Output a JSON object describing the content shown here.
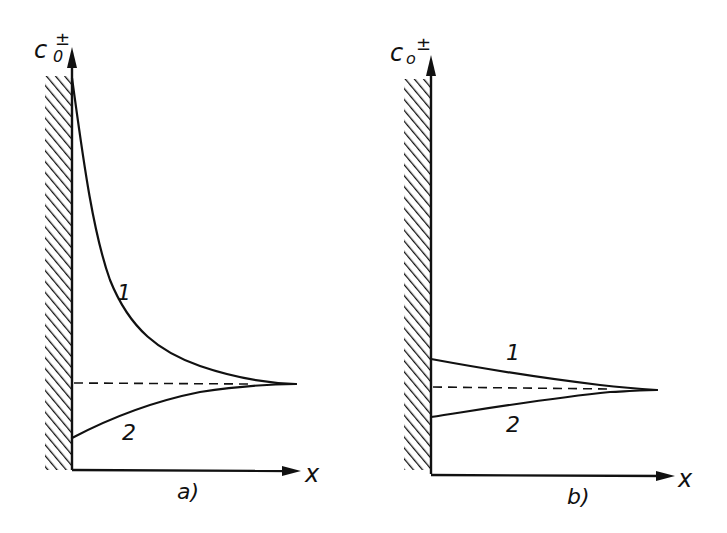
{
  "panels": [
    {
      "id": "a",
      "caption": "a)",
      "y_axis_label": "c",
      "y_axis_subscript": "0",
      "y_axis_superscript": "±",
      "x_axis_label": "x",
      "curves": [
        {
          "label": "1",
          "description": "concentration decays from high value at wall to bulk value"
        },
        {
          "label": "2",
          "description": "concentration rises from low value at wall to bulk value"
        }
      ],
      "reference_line": "bulk concentration (dashed)"
    },
    {
      "id": "b",
      "caption": "b)",
      "y_axis_label": "c",
      "y_axis_subscript": "o",
      "y_axis_superscript": "±",
      "x_axis_label": "x",
      "curves": [
        {
          "label": "1",
          "description": "slightly elevated at wall, approaches bulk value"
        },
        {
          "label": "2",
          "description": "slightly depressed at wall, approaches bulk value"
        }
      ],
      "reference_line": "bulk concentration (dashed)"
    }
  ],
  "colors": {
    "ink": "#111111",
    "background": "#ffffff"
  }
}
